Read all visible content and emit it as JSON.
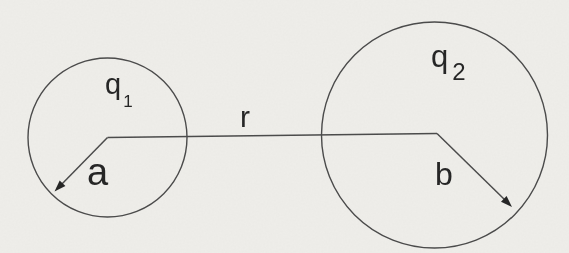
{
  "diagram": {
    "paper_color": "#efeeea",
    "line_color": "#4b4b4b",
    "ink_color": "#282828",
    "sphere_small": {
      "charge_label": "q",
      "charge_subscript": "1",
      "radius_label": "a"
    },
    "sphere_large": {
      "charge_label": "q",
      "charge_subscript": "2",
      "radius_label": "b"
    },
    "separation_label": "r"
  }
}
